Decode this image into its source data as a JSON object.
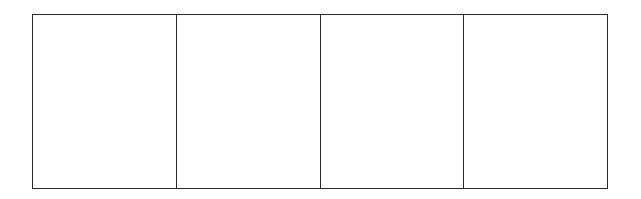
{
  "diagram": {
    "type": "empty-panel-grid",
    "rows": 1,
    "columns": 4,
    "cells": [
      {
        "index": 1,
        "content": ""
      },
      {
        "index": 2,
        "content": ""
      },
      {
        "index": 3,
        "content": ""
      },
      {
        "index": 4,
        "content": ""
      }
    ],
    "border_color": "#2b2b2b",
    "background_color": "#ffffff"
  }
}
